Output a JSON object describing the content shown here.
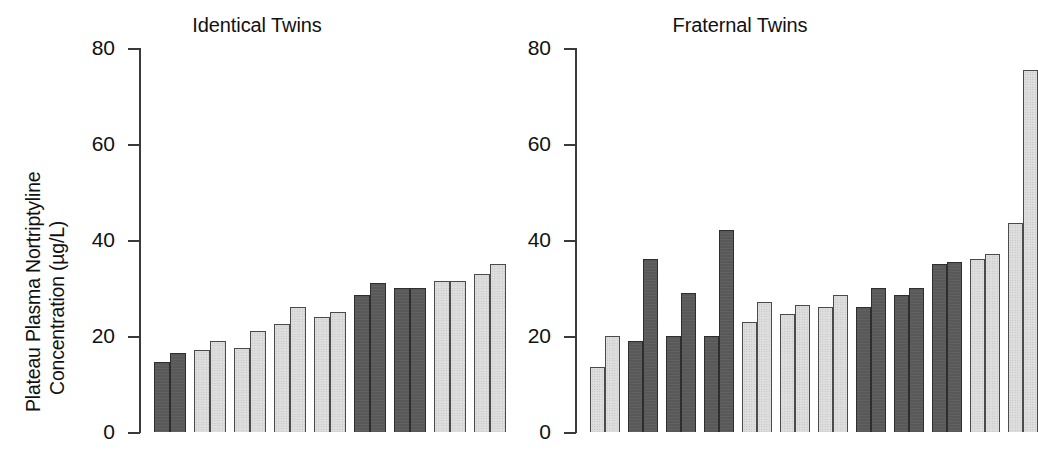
{
  "figure": {
    "ylabel_line1": "Plateau Plasma Nortriptyline",
    "ylabel_line2": "Concentration (µg/L)"
  },
  "panels": [
    {
      "title": "Identical Twins"
    },
    {
      "title": "Fraternal Twins"
    }
  ],
  "axis": {
    "ticks": [
      {
        "label": "80",
        "value": 80
      },
      {
        "label": "60",
        "value": 60
      },
      {
        "label": "40",
        "value": 40
      },
      {
        "label": "20",
        "value": 20
      },
      {
        "label": "0",
        "value": 0
      }
    ]
  },
  "colors": {
    "dark_bar": "#595959",
    "light_bar": "#dedede",
    "outline": "#4a4a4a",
    "text": "#111111",
    "background": "#ffffff"
  },
  "chart_data": {
    "type": "bar",
    "xlabel": "",
    "ylabel": "Plateau Plasma Nortriptyline Concentration (µg/L)",
    "ylim": [
      0,
      80
    ],
    "yticks": [
      0,
      20,
      40,
      60,
      80
    ],
    "grid": false,
    "legend": "none",
    "panels": [
      {
        "name": "Identical Twins",
        "categories": [
          "Pair 1",
          "Pair 2",
          "Pair 3",
          "Pair 4",
          "Pair 5",
          "Pair 6",
          "Pair 7",
          "Pair 8",
          "Pair 9"
        ],
        "series": [
          {
            "name": "Twin A",
            "values": [
              14.5,
              17.0,
              17.5,
              22.5,
              24.0,
              28.5,
              30.0,
              31.5,
              33.0
            ]
          },
          {
            "name": "Twin B",
            "values": [
              16.5,
              19.0,
              21.0,
              26.0,
              25.0,
              31.0,
              30.0,
              31.5,
              35.0
            ]
          }
        ],
        "bar_shades": [
          "dark",
          "light",
          "light",
          "light",
          "light",
          "dark",
          "dark",
          "light",
          "light"
        ]
      },
      {
        "name": "Fraternal Twins",
        "categories": [
          "Pair 1",
          "Pair 2",
          "Pair 3",
          "Pair 4",
          "Pair 5",
          "Pair 6",
          "Pair 7",
          "Pair 8",
          "Pair 9",
          "Pair 10",
          "Pair 11",
          "Pair 12"
        ],
        "series": [
          {
            "name": "Twin A",
            "values": [
              13.5,
              19.0,
              20.0,
              20.0,
              23.0,
              24.5,
              26.0,
              26.0,
              28.5,
              35.0,
              36.0,
              43.5
            ]
          },
          {
            "name": "Twin B",
            "values": [
              20.0,
              36.0,
              29.0,
              42.0,
              27.0,
              26.5,
              28.5,
              30.0,
              30.0,
              35.5,
              37.0,
              75.5
            ]
          }
        ],
        "bar_shades": [
          "light",
          "dark",
          "dark",
          "dark",
          "light",
          "light",
          "light",
          "dark",
          "dark",
          "dark",
          "light",
          "light"
        ]
      }
    ]
  }
}
